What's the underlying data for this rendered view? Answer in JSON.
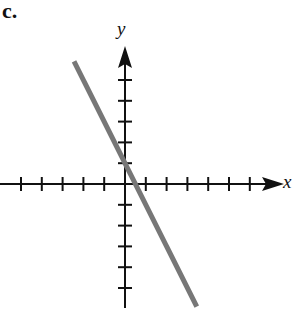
{
  "figure": {
    "part_label": "c.",
    "x_axis_label": "x",
    "y_axis_label": "y"
  },
  "chart_data": {
    "type": "line",
    "title": "c.",
    "xlabel": "x",
    "ylabel": "y",
    "xlim": [
      -6,
      7.5
    ],
    "ylim": [
      -6,
      7
    ],
    "x_ticks": [
      -5,
      -4,
      -3,
      -2,
      -1,
      1,
      2,
      3,
      4,
      5,
      6
    ],
    "y_ticks": [
      -5,
      -4,
      -3,
      -2,
      -1,
      1,
      2,
      3,
      4,
      5
    ],
    "tick_labels_shown": false,
    "grid": false,
    "legend": null,
    "series": [
      {
        "name": "line",
        "equation": "y = -2x + 1",
        "slope": -2,
        "y_intercept": 1,
        "x_intercept": 0.5,
        "color": "#777777",
        "points": [
          {
            "x": -2.45,
            "y": 5.9
          },
          {
            "x": 3.45,
            "y": -5.9
          }
        ]
      }
    ],
    "colors": {
      "axes": "#111111",
      "line": "#777777"
    }
  }
}
